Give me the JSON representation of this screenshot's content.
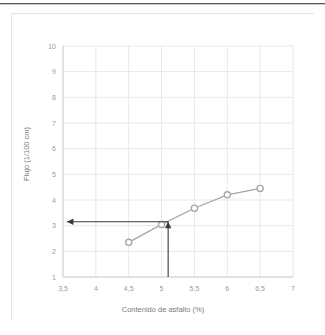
{
  "chart_data": {
    "type": "line",
    "title": "",
    "xlabel": "Contenido de asfalto (%)",
    "ylabel": "Flujo (1/100 cm)",
    "xlim": [
      3.5,
      7
    ],
    "ylim": [
      1,
      10
    ],
    "grid": true,
    "legend": "none",
    "x_ticks": [
      "3,5",
      "4",
      "4,5",
      "5",
      "5,5",
      "6",
      "6,5",
      "7"
    ],
    "x_tick_values": [
      3.5,
      4,
      4.5,
      5,
      5.5,
      6,
      6.5,
      7
    ],
    "y_ticks": [
      "1",
      "2",
      "3",
      "4",
      "5",
      "6",
      "7",
      "8",
      "9",
      "10"
    ],
    "y_tick_values": [
      1,
      2,
      3,
      4,
      5,
      6,
      7,
      8,
      9,
      10
    ],
    "series": [
      {
        "name": "Flujo",
        "color": "#a6a6a6",
        "marker": "circle-open",
        "x": [
          4.5,
          5.0,
          5.5,
          6.0,
          6.5
        ],
        "values": [
          2.35,
          3.05,
          3.68,
          4.2,
          4.45
        ]
      }
    ],
    "annotations": [
      {
        "name": "vertical-reference-arrow",
        "kind": "arrow",
        "from": [
          5.1,
          1.0
        ],
        "to": [
          5.1,
          3.15
        ],
        "color": "#3a3a3a"
      },
      {
        "name": "horizontal-reference-arrow",
        "kind": "arrow",
        "from": [
          5.1,
          3.15
        ],
        "to": [
          3.56,
          3.15
        ],
        "color": "#3a3a3a"
      }
    ]
  },
  "chart": {
    "xlabel": "Contenido de asfalto (%)",
    "ylabel": "Flujo (1/100 cm)"
  },
  "colors": {
    "series": "#a6a6a6",
    "grid": "#e8e8e8",
    "axis": "#d2d2d2",
    "tick_text": "#9a9a9a",
    "axis_title_text": "#7c7c7c",
    "annotation": "#3a3a3a",
    "card_border": "#e4e4e4",
    "top_rule": "#5a5a5a"
  }
}
